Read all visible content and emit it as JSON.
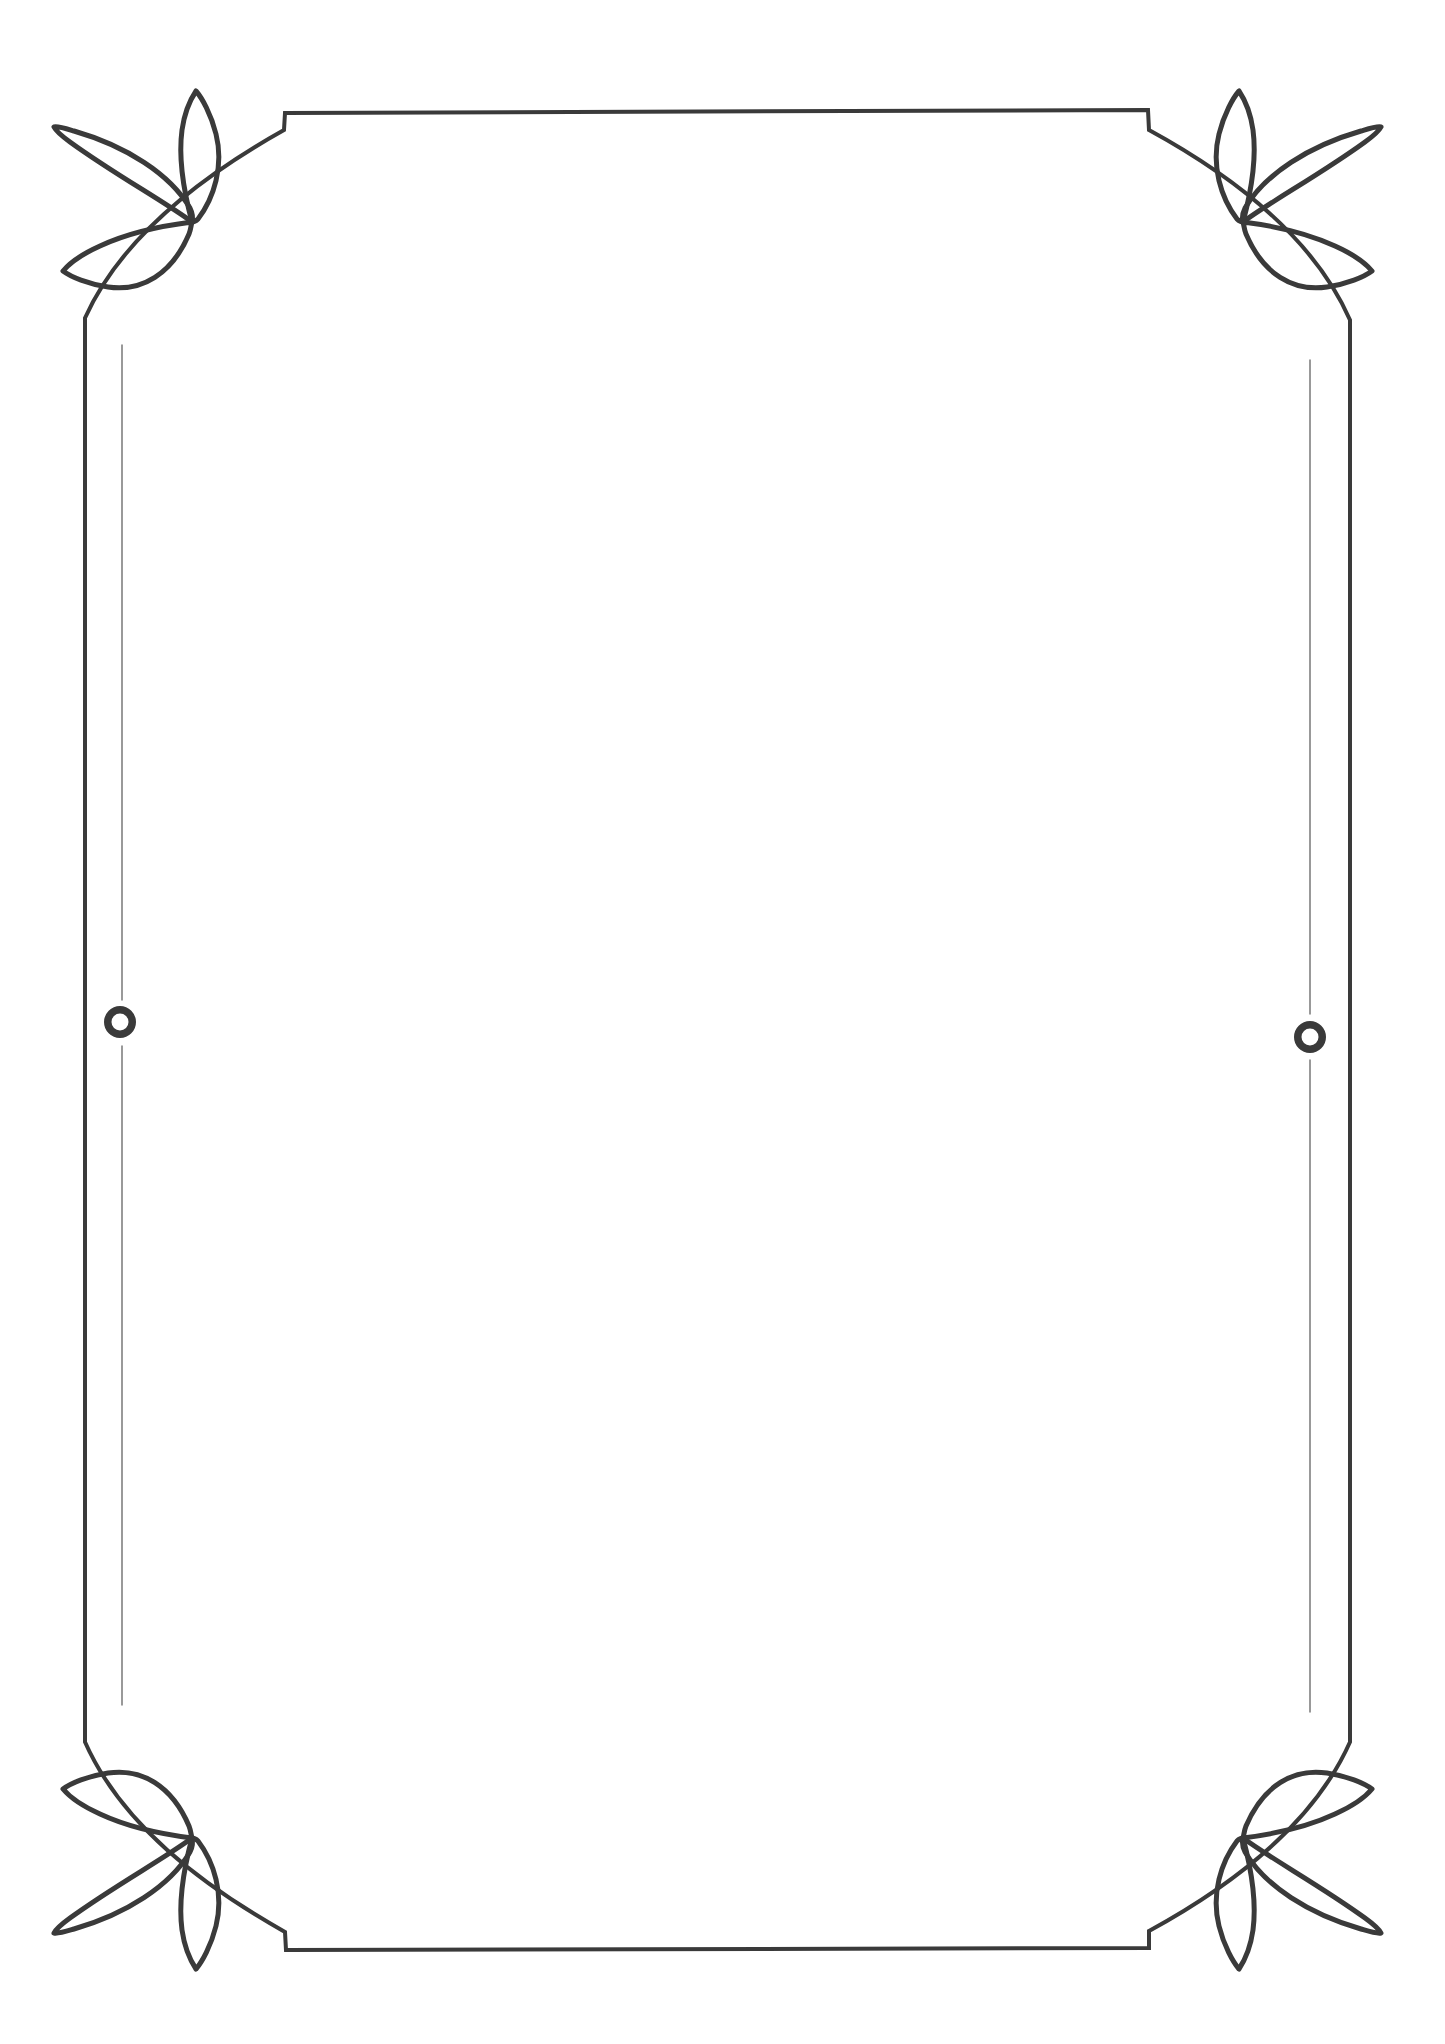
{
  "document": {
    "kind": "decorative-page-border",
    "title": "Leaf Corner Ornament Frame",
    "canvas": {
      "width": 1445,
      "height": 2044,
      "background_color": "#ffffff"
    },
    "style": {
      "ink_color": "#3a3a3a",
      "faint_ink_color": "#6e6e6e",
      "outer_stroke_width": 4,
      "ornament_stroke_width": 5,
      "inner_rule_stroke_width": 1.4,
      "ring_stroke_width": 5
    },
    "frame": {
      "label": "Outer border frame",
      "left": 85,
      "right": 1350,
      "top": 113,
      "bottom": 1948,
      "corner_radius": 200,
      "step_left_x": 281,
      "step_right_x": 1152,
      "step_depth": 17
    },
    "inner_rules": [
      {
        "label": "Left inner vertical rule",
        "x": 122,
        "y_start": 345,
        "y_end": 1705
      },
      {
        "label": "Right inner vertical rule",
        "x": 1310,
        "y_start": 360,
        "y_end": 1712
      }
    ],
    "rings": [
      {
        "label": "Left side ring accent",
        "cx": 120,
        "cy": 1022,
        "outer_radius": 16,
        "inner_radius": 8.5,
        "gap_above": 1000,
        "gap_below": 1046
      },
      {
        "label": "Right side ring accent",
        "cx": 1310,
        "cy": 1037,
        "outer_radius": 16,
        "inner_radius": 8.5,
        "gap_above": 1014,
        "gap_below": 1060
      }
    ],
    "ornaments": [
      {
        "id": "top-left",
        "label": "Top-left three-leaf ornament",
        "anchor_x": 192,
        "anchor_y": 222,
        "flip_x": 1,
        "flip_y": 1,
        "leaf_count": 3
      },
      {
        "id": "top-right",
        "label": "Top-right three-leaf ornament",
        "anchor_x": 1243,
        "anchor_y": 222,
        "flip_x": -1,
        "flip_y": 1,
        "leaf_count": 3
      },
      {
        "id": "bottom-left",
        "label": "Bottom-left three-leaf ornament",
        "anchor_x": 192,
        "anchor_y": 1838,
        "flip_x": 1,
        "flip_y": -1,
        "leaf_count": 3
      },
      {
        "id": "bottom-right",
        "label": "Bottom-right three-leaf ornament",
        "anchor_x": 1243,
        "anchor_y": 1838,
        "flip_x": -1,
        "flip_y": -1,
        "leaf_count": 3
      }
    ],
    "body_text": ""
  }
}
